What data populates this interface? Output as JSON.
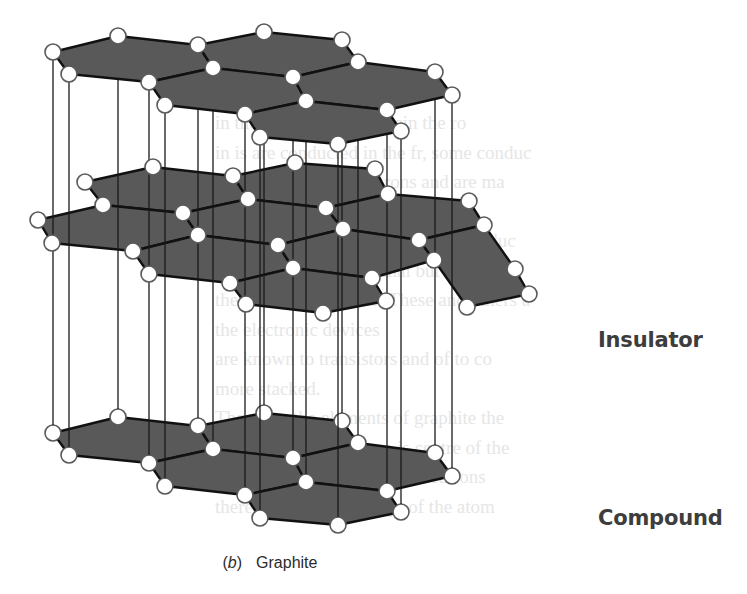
{
  "figure": {
    "caption_part_label": "(b)",
    "caption_part_letter": "b",
    "caption_title": "Graphite"
  },
  "sidebar_terms": [
    {
      "label": "Insulator",
      "x": 598,
      "y": 344
    },
    {
      "label": "Compound",
      "x": 598,
      "y": 522
    }
  ],
  "style": {
    "sheet_fill": "#595959",
    "bond_color": "#111111",
    "interlayer_line_color": "#1a1a1a",
    "atom_fill": "#ffffff",
    "atom_stroke": "#5a5a5a",
    "atom_radius": 8
  },
  "bleed_through_text": [
    "                                       ",
    "   in the Universe as wherein the ro",
    "  in is are conducted in the fr, some conduc",
    "  ducts the flow of electrons and are ma",
    "  with the rather",
    "  Silicon and germanium are semiconduc",
    "  not conduct under normal but in",
    "  they are good circuits. These and others a",
    "           the electronic devices",
    "  are known to transistors and of to co",
    "  more stacked.",
    "  These are the elements of graphite the",
    "  the nucleus of the atom is centre of the",
    "  (1) It contains protons and neutrons",
    "  there is a positive charge of the atom"
  ],
  "layers": {
    "top": {
      "atoms": [
        [
          53,
          52
        ],
        [
          118,
          36
        ],
        [
          198,
          45
        ],
        [
          264,
          32
        ],
        [
          342,
          40
        ],
        [
          69,
          74
        ],
        [
          149,
          82
        ],
        [
          213,
          68
        ],
        [
          293,
          77
        ],
        [
          358,
          62
        ],
        [
          435,
          72
        ],
        [
          165,
          105
        ],
        [
          245,
          114
        ],
        [
          306,
          101
        ],
        [
          387,
          110
        ],
        [
          452,
          95
        ],
        [
          260,
          137
        ],
        [
          338,
          144
        ],
        [
          401,
          131
        ]
      ],
      "hexagons": [
        [
          [
            53,
            52
          ],
          [
            118,
            36
          ],
          [
            198,
            45
          ],
          [
            213,
            68
          ],
          [
            149,
            82
          ],
          [
            69,
            74
          ]
        ],
        [
          [
            198,
            45
          ],
          [
            264,
            32
          ],
          [
            342,
            40
          ],
          [
            358,
            62
          ],
          [
            293,
            77
          ],
          [
            213,
            68
          ]
        ],
        [
          [
            149,
            82
          ],
          [
            213,
            68
          ],
          [
            293,
            77
          ],
          [
            306,
            101
          ],
          [
            245,
            114
          ],
          [
            165,
            105
          ]
        ],
        [
          [
            293,
            77
          ],
          [
            358,
            62
          ],
          [
            435,
            72
          ],
          [
            452,
            95
          ],
          [
            387,
            110
          ],
          [
            306,
            101
          ]
        ],
        [
          [
            245,
            114
          ],
          [
            306,
            101
          ],
          [
            387,
            110
          ],
          [
            401,
            131
          ],
          [
            338,
            144
          ],
          [
            260,
            137
          ]
        ]
      ]
    },
    "middle": {
      "atoms": [
        [
          85,
          182
        ],
        [
          153,
          167
        ],
        [
          233,
          176
        ],
        [
          295,
          163
        ],
        [
          375,
          169
        ],
        [
          103,
          205
        ],
        [
          183,
          213
        ],
        [
          248,
          199
        ],
        [
          326,
          208
        ],
        [
          388,
          194
        ],
        [
          469,
          201
        ],
        [
          38,
          220
        ],
        [
          52,
          243
        ],
        [
          133,
          251
        ],
        [
          198,
          235
        ],
        [
          278,
          245
        ],
        [
          343,
          229
        ],
        [
          419,
          240
        ],
        [
          484,
          225
        ],
        [
          149,
          274
        ],
        [
          230,
          283
        ],
        [
          293,
          268
        ],
        [
          372,
          278
        ],
        [
          434,
          260
        ],
        [
          515,
          269
        ],
        [
          529,
          294
        ],
        [
          246,
          304
        ],
        [
          323,
          313
        ],
        [
          386,
          301
        ],
        [
          467,
          307
        ]
      ],
      "hexagons": [
        [
          [
            85,
            182
          ],
          [
            153,
            167
          ],
          [
            233,
            176
          ],
          [
            248,
            199
          ],
          [
            183,
            213
          ],
          [
            103,
            205
          ]
        ],
        [
          [
            233,
            176
          ],
          [
            295,
            163
          ],
          [
            375,
            169
          ],
          [
            388,
            194
          ],
          [
            326,
            208
          ],
          [
            248,
            199
          ]
        ],
        [
          [
            38,
            220
          ],
          [
            103,
            205
          ],
          [
            183,
            213
          ],
          [
            198,
            235
          ],
          [
            133,
            251
          ],
          [
            52,
            243
          ]
        ],
        [
          [
            183,
            213
          ],
          [
            248,
            199
          ],
          [
            326,
            208
          ],
          [
            343,
            229
          ],
          [
            278,
            245
          ],
          [
            198,
            235
          ]
        ],
        [
          [
            326,
            208
          ],
          [
            388,
            194
          ],
          [
            469,
            201
          ],
          [
            484,
            225
          ],
          [
            419,
            240
          ],
          [
            343,
            229
          ]
        ],
        [
          [
            133,
            251
          ],
          [
            198,
            235
          ],
          [
            278,
            245
          ],
          [
            293,
            268
          ],
          [
            230,
            283
          ],
          [
            149,
            274
          ]
        ],
        [
          [
            278,
            245
          ],
          [
            343,
            229
          ],
          [
            419,
            240
          ],
          [
            434,
            260
          ],
          [
            372,
            278
          ],
          [
            293,
            268
          ]
        ],
        [
          [
            230,
            283
          ],
          [
            293,
            268
          ],
          [
            372,
            278
          ],
          [
            386,
            301
          ],
          [
            323,
            313
          ],
          [
            246,
            304
          ]
        ],
        [
          [
            419,
            240
          ],
          [
            484,
            225
          ],
          [
            515,
            269
          ],
          [
            529,
            294
          ],
          [
            467,
            307
          ],
          [
            434,
            260
          ]
        ]
      ]
    },
    "bottom_offset_y": 381
  },
  "interlayer_lines_x": [
    53,
    69,
    118,
    149,
    165,
    198,
    213,
    246,
    262,
    306,
    337,
    358,
    387,
    402,
    436,
    452
  ],
  "interlayer_lines": [
    [
      53,
      52,
      53,
      433
    ],
    [
      69,
      74,
      69,
      455
    ],
    [
      118,
      36,
      118,
      417
    ],
    [
      149,
      82,
      149,
      463
    ],
    [
      165,
      105,
      165,
      486
    ],
    [
      198,
      45,
      198,
      426
    ],
    [
      213,
      68,
      213,
      449
    ],
    [
      245,
      114,
      245,
      495
    ],
    [
      260,
      137,
      260,
      518
    ],
    [
      306,
      101,
      306,
      482
    ],
    [
      338,
      144,
      338,
      525
    ],
    [
      358,
      62,
      358,
      443
    ],
    [
      387,
      110,
      387,
      491
    ],
    [
      401,
      131,
      401,
      512
    ],
    [
      435,
      72,
      435,
      453
    ],
    [
      452,
      95,
      452,
      476
    ],
    [
      264,
      32,
      264,
      413
    ],
    [
      293,
      77,
      293,
      458
    ],
    [
      342,
      40,
      342,
      421
    ]
  ]
}
